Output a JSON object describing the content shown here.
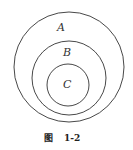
{
  "diagram": {
    "type": "nested-circles",
    "circles": [
      {
        "id": "A",
        "label": "A",
        "cx": 69,
        "cy": 67,
        "r": 55,
        "label_x": 57,
        "label_y": 31
      },
      {
        "id": "B",
        "label": "B",
        "cx": 69,
        "cy": 78,
        "r": 37,
        "label_x": 63,
        "label_y": 56
      },
      {
        "id": "C",
        "label": "C",
        "cx": 68,
        "cy": 85,
        "r": 21,
        "label_x": 63,
        "label_y": 88
      }
    ],
    "stroke_color": "#333333"
  },
  "caption": {
    "prefix": "图",
    "number": "1-2"
  }
}
